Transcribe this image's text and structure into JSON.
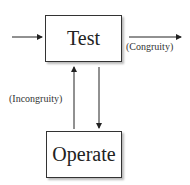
{
  "diagram": {
    "nodes": [
      {
        "id": "test",
        "label": "Test"
      },
      {
        "id": "operate",
        "label": "Operate"
      }
    ],
    "edges": [
      {
        "from": "input",
        "to": "test",
        "label": ""
      },
      {
        "from": "test",
        "to": "exit",
        "label": "(Congruity)"
      },
      {
        "from": "operate",
        "to": "test",
        "label": "(Incongruity)"
      },
      {
        "from": "test",
        "to": "operate",
        "label": ""
      }
    ]
  }
}
